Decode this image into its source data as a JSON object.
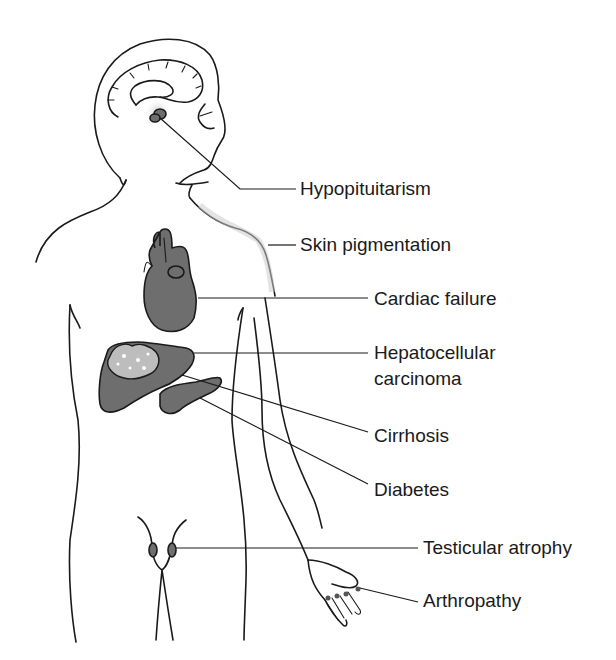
{
  "diagram": {
    "type": "anatomical-figure",
    "colors": {
      "line": "#1a1a1a",
      "organ_fill": "#6e6e6e",
      "tumor_fill": "#bdbdbd",
      "background": "#ffffff"
    },
    "labels": [
      {
        "id": "hypopituitarism",
        "text": "Hypopituitarism",
        "target": "pituitary"
      },
      {
        "id": "skin-pigmentation",
        "text": "Skin pigmentation",
        "target": "shoulder skin"
      },
      {
        "id": "cardiac-failure",
        "text": "Cardiac failure",
        "target": "heart"
      },
      {
        "id": "hepatocellular-carcinoma",
        "text": "Hepatocellular carcinoma",
        "line1": "Hepatocellular",
        "line2": "carcinoma",
        "target": "liver tumor"
      },
      {
        "id": "cirrhosis",
        "text": "Cirrhosis",
        "target": "liver"
      },
      {
        "id": "diabetes",
        "text": "Diabetes",
        "target": "pancreas"
      },
      {
        "id": "testicular-atrophy",
        "text": "Testicular atrophy",
        "target": "testes"
      },
      {
        "id": "arthropathy",
        "text": "Arthropathy",
        "target": "finger joints"
      }
    ]
  }
}
